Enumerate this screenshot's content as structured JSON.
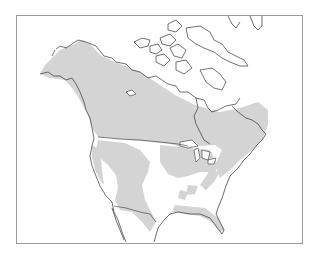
{
  "map": {
    "type": "range-map",
    "region": "North America",
    "colors": {
      "background": "#ffffff",
      "frame": "#9a9a9a",
      "range_fill": "#d4d4d4",
      "outline": "#333333"
    }
  }
}
